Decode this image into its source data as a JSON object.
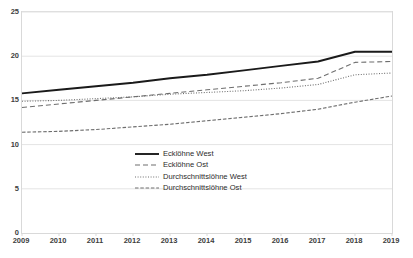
{
  "chart_data": {
    "type": "line",
    "title": "",
    "xlabel": "",
    "ylabel": "",
    "x": [
      2009,
      2010,
      2011,
      2012,
      2013,
      2014,
      2015,
      2016,
      2017,
      2018,
      2019
    ],
    "categories": [
      "2009",
      "2010",
      "2011",
      "2012",
      "2013",
      "2014",
      "2015",
      "2016",
      "2017",
      "2018",
      "2019"
    ],
    "ylim": [
      0,
      25
    ],
    "yticks": [
      0,
      5,
      10,
      15,
      20,
      25
    ],
    "ytick_labels": [
      "0",
      "5",
      "10",
      "15",
      "20",
      "25"
    ],
    "grid": true,
    "legend_position": "center",
    "series": [
      {
        "name": "Ecklöhne West",
        "style": "solid",
        "color": "#1a1a1a",
        "width": 1.9,
        "values": [
          15.8,
          16.2,
          16.6,
          17.0,
          17.5,
          17.9,
          18.4,
          18.9,
          19.4,
          20.5,
          20.5
        ]
      },
      {
        "name": "Ecklöhne Ost",
        "style": "dashed",
        "color": "#6e6e6e",
        "width": 1.1,
        "values": [
          14.2,
          14.6,
          15.0,
          15.4,
          15.8,
          16.2,
          16.6,
          17.0,
          17.5,
          19.3,
          19.4
        ]
      },
      {
        "name": "Durchschnittslöhne West",
        "style": "dotted",
        "color": "#6e6e6e",
        "width": 1.1,
        "values": [
          14.9,
          15.0,
          15.2,
          15.4,
          15.7,
          15.9,
          16.1,
          16.4,
          16.8,
          17.9,
          18.1
        ]
      },
      {
        "name": "Durchschnittslöhne Ost",
        "style": "dashdot",
        "color": "#6e6e6e",
        "width": 1.1,
        "values": [
          11.4,
          11.5,
          11.7,
          12.0,
          12.3,
          12.7,
          13.1,
          13.5,
          14.0,
          14.8,
          15.5
        ]
      }
    ],
    "legend_entries": [
      {
        "label": "Ecklöhne West",
        "style": "solid"
      },
      {
        "label": "Ecklöhne Ost",
        "style": "dashed"
      },
      {
        "label": "Durchschnittslöhne West",
        "style": "dotted"
      },
      {
        "label": "Durchschnittslöhne Ost",
        "style": "dashdot"
      }
    ],
    "colors": {
      "plot_background": "#ffffff",
      "grid": "#e4e4e4",
      "axis": "#d9d9d9",
      "text": "#404040",
      "series_primary": "#1a1a1a",
      "series_secondary": "#6e6e6e"
    }
  }
}
